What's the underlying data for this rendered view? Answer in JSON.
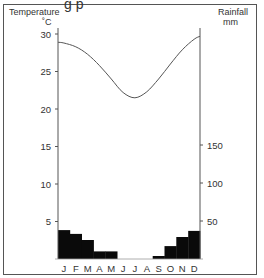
{
  "chart_data": {
    "type": "bar+line",
    "title": "",
    "categories": [
      "J",
      "F",
      "M",
      "A",
      "M",
      "J",
      "J",
      "A",
      "S",
      "O",
      "N",
      "D"
    ],
    "series": [
      {
        "name": "Rainfall",
        "type": "bar",
        "axis": "right",
        "unit": "mm",
        "values": [
          38,
          33,
          25,
          10,
          10,
          0,
          0,
          0,
          4,
          17,
          29,
          37
        ]
      },
      {
        "name": "Temperature",
        "type": "line",
        "axis": "left",
        "unit": "°C",
        "values": [
          28.8,
          28.3,
          27.3,
          25.8,
          24.0,
          22.2,
          21.5,
          22.3,
          24.0,
          26.0,
          27.9,
          29.3
        ],
        "start_value": 28.9,
        "end_value": 29.7
      }
    ],
    "left_axis": {
      "label": "Temperature",
      "unit_label": "˚C",
      "ticks": [
        5,
        10,
        15,
        20,
        25,
        30
      ],
      "range": [
        0,
        30
      ]
    },
    "right_axis": {
      "label": "Rainfall",
      "unit_label": "mm",
      "ticks": [
        50,
        100,
        150
      ],
      "range": [
        0,
        300
      ]
    },
    "grid": false,
    "legend": "none"
  }
}
